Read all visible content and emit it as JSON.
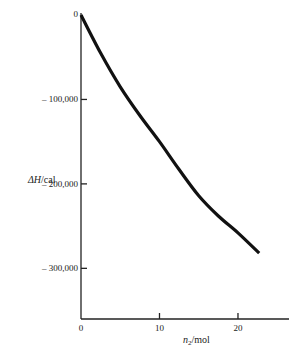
{
  "chart_data": {
    "type": "line",
    "title": "",
    "xlabel_var": "n",
    "xlabel_sub": "2",
    "xlabel_unit": "/mol",
    "ylabel_var": "ΔH",
    "ylabel_unit": "/cal",
    "xlim": [
      0,
      26.5
    ],
    "ylim": [
      -360000,
      0
    ],
    "grid": false,
    "legend": "none",
    "x_ticks": [
      {
        "value": 0,
        "label": "0"
      },
      {
        "value": 10,
        "label": "10"
      },
      {
        "value": 20,
        "label": "20"
      }
    ],
    "y_ticks": [
      {
        "value": 0,
        "label": "0"
      },
      {
        "value": -100000,
        "label": "– 100,000"
      },
      {
        "value": -200000,
        "label": "– 200,000"
      },
      {
        "value": -300000,
        "label": "– 300,000"
      }
    ],
    "series": [
      {
        "name": "ΔH",
        "color": "#111111",
        "x": [
          0,
          2.5,
          5,
          7.5,
          10,
          12.5,
          15,
          17.5,
          20,
          22.7
        ],
        "y": [
          0,
          -45000,
          -85000,
          -119000,
          -150000,
          -183000,
          -214000,
          -238000,
          -258000,
          -282000
        ]
      }
    ]
  }
}
